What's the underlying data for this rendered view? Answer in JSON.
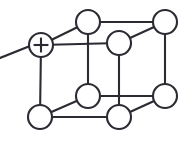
{
  "figure": {
    "background_color": "#ffffff",
    "line_color": "#2b2b33",
    "node_fill_color": "#ffffff",
    "width": 188,
    "height": 142
  },
  "chart_data": {
    "type": "diagram",
    "node_radius": 12,
    "nodes": [
      {
        "id": "front-top-left",
        "label": "+",
        "marker": "plus",
        "cx": 41,
        "cy": 45
      },
      {
        "id": "back-top-left",
        "label": "",
        "marker": "plain",
        "cx": 88,
        "cy": 22
      },
      {
        "id": "back-top-right",
        "label": "",
        "marker": "plain",
        "cx": 165,
        "cy": 22
      },
      {
        "id": "front-top-right",
        "label": "",
        "marker": "plain",
        "cx": 119,
        "cy": 43
      },
      {
        "id": "front-bottom-left",
        "label": "",
        "marker": "plain",
        "cx": 40,
        "cy": 117
      },
      {
        "id": "back-bottom-left",
        "label": "",
        "marker": "plain",
        "cx": 88,
        "cy": 96
      },
      {
        "id": "front-bottom-right",
        "label": "",
        "marker": "plain",
        "cx": 119,
        "cy": 117
      },
      {
        "id": "back-bottom-right",
        "label": "",
        "marker": "plain",
        "cx": 165,
        "cy": 96
      }
    ],
    "edges": [
      {
        "id": "edge-front-top-left--back-top-left",
        "from": "front-top-left",
        "to": "back-top-left"
      },
      {
        "id": "edge-back-top-left--back-top-right",
        "from": "back-top-left",
        "to": "back-top-right"
      },
      {
        "id": "edge-front-top-left--front-top-right",
        "from": "front-top-left",
        "to": "front-top-right"
      },
      {
        "id": "edge-front-top-right--back-top-right",
        "from": "front-top-right",
        "to": "back-top-right"
      },
      {
        "id": "edge-front-top-left--front-bottom-left",
        "from": "front-top-left",
        "to": "front-bottom-left"
      },
      {
        "id": "edge-back-top-left--back-bottom-left",
        "from": "back-top-left",
        "to": "back-bottom-left"
      },
      {
        "id": "edge-back-top-right--back-bottom-right",
        "from": "back-top-right",
        "to": "back-bottom-right"
      },
      {
        "id": "edge-front-top-right--front-bottom-right",
        "from": "front-top-right",
        "to": "front-bottom-right"
      },
      {
        "id": "edge-front-bottom-left--back-bottom-left",
        "from": "front-bottom-left",
        "to": "back-bottom-left"
      },
      {
        "id": "edge-back-bottom-left--back-bottom-right",
        "from": "back-bottom-left",
        "to": "back-bottom-right"
      },
      {
        "id": "edge-front-bottom-left--front-bottom-right",
        "from": "front-bottom-left",
        "to": "front-bottom-right"
      },
      {
        "id": "edge-front-bottom-right--back-bottom-right",
        "from": "front-bottom-right",
        "to": "back-bottom-right"
      }
    ],
    "stubs": [
      {
        "id": "stub-left",
        "x1": 0,
        "y1": 58,
        "x2": 30,
        "y2": 46
      }
    ],
    "annotations": [
      {
        "id": "plus-marker",
        "node": "front-top-left",
        "symbol": "+"
      }
    ]
  }
}
